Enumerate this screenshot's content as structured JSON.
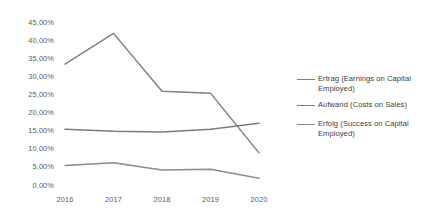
{
  "chart_data": {
    "type": "line",
    "title": "",
    "subtitle": "",
    "xlabel": "",
    "ylabel": "",
    "categories": [
      "2016",
      "2017",
      "2018",
      "2019",
      "2020"
    ],
    "x": [
      2016,
      2017,
      2018,
      2019,
      2020
    ],
    "ylim": [
      0,
      45
    ],
    "yticks": [
      0,
      5,
      10,
      15,
      20,
      25,
      30,
      35,
      40,
      45
    ],
    "ytick_labels": [
      "0,00%",
      "5,00%",
      "10,00%",
      "15,00%",
      "20,00%",
      "25,00%",
      "30,00%",
      "35,00%",
      "40,00%",
      "45,00%"
    ],
    "grid": false,
    "axis_lines": false,
    "legend_position": "right",
    "series": [
      {
        "name": "Ertrag (Earnings on Capital Employed)",
        "color": "#808080",
        "values": [
          33.5,
          42.0,
          26.0,
          25.5,
          9.0
        ]
      },
      {
        "name": "Aufwand (Costs on Sales)",
        "color": "#7a7a7a",
        "values": [
          15.5,
          15.0,
          14.8,
          15.5,
          17.2
        ]
      },
      {
        "name": "Erfolg (Success on Capital Employed)",
        "color": "#8c8c8c",
        "values": [
          5.5,
          6.3,
          4.3,
          4.5,
          2.0
        ]
      }
    ]
  },
  "legend": {
    "entries": [
      {
        "label": "Ertrag (Earnings on Capital Employed)",
        "color": "#808080"
      },
      {
        "label": "Aufwand (Costs on Sales)",
        "color": "#7a7a7a"
      },
      {
        "label": "Erfolg (Success on Capital Employed)",
        "color": "#8c8c8c"
      }
    ]
  },
  "colors": {
    "background": "#ffffff",
    "tick_text": "#5a5a5a",
    "legend_text": "#404040"
  }
}
